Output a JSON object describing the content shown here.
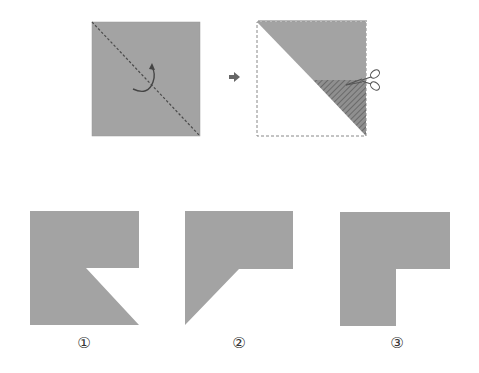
{
  "diagram": {
    "colors": {
      "paper": "#a3a3a3",
      "paper_edge": "#8c8c8c",
      "fold_line": "#555555",
      "hatch": "#777777",
      "dashed_outline": "#888888",
      "arrow": "#666666",
      "background": "#ffffff"
    },
    "steps": [
      {
        "id": "step-1",
        "description": "Square paper with diagonal fold line and curved fold arrow",
        "icons": [
          "fold-arrow-icon"
        ]
      },
      {
        "id": "step-2",
        "description": "Folded triangle with horizontal cut from right edge; cut-away region hatched",
        "icons": [
          "scissors-icon"
        ]
      }
    ],
    "transition_icon": "right-arrow-icon",
    "options": [
      {
        "label": "①",
        "shape": "square with lower-right notch cut diagonally"
      },
      {
        "label": "②",
        "shape": "square with lower-right removed and diagonal bottom-left edge"
      },
      {
        "label": "③",
        "shape": "L-shape with lower-right square removed"
      }
    ]
  }
}
